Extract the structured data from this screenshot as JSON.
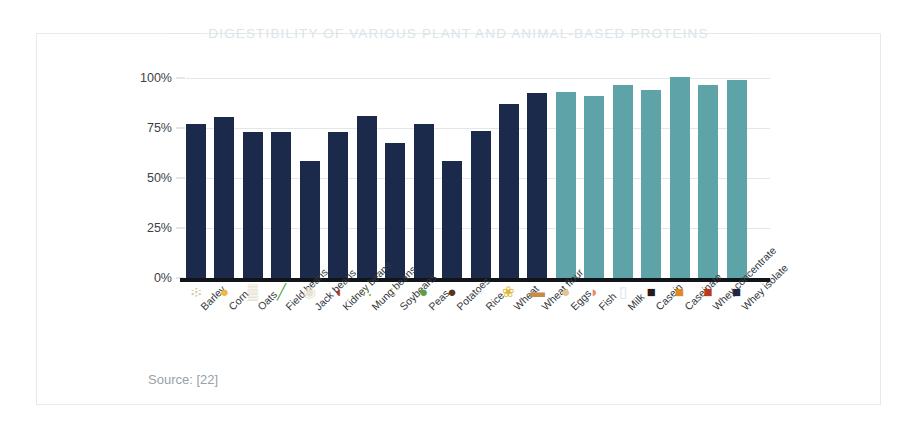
{
  "frame": {
    "border_color": "#e3ebee"
  },
  "header": {
    "title": "DIGESTIBILITY OF VARIOUS PLANT AND ANIMAL-BASED PROTEINS",
    "title_color": "#dce4e8",
    "rule_color": "#dfe6ea"
  },
  "footer": {
    "source": "Source: [22]"
  },
  "palette": {
    "plant_bar": "#1b2a4a",
    "animal_bar": "#5ea3a8",
    "gridline": "#e4e7e9",
    "axis": "#111418",
    "tick_text": "#3b3f46"
  },
  "chart_data": {
    "type": "bar",
    "title": "DIGESTIBILITY OF VARIOUS PLANT AND ANIMAL-BASED PROTEINS",
    "xlabel": "",
    "ylabel": "",
    "ylim": [
      0,
      100
    ],
    "yticks": [
      "0%",
      "25%",
      "50%",
      "75%",
      "100%"
    ],
    "ytick_values": [
      0,
      25,
      50,
      75,
      100
    ],
    "grid": true,
    "legend": "none",
    "unit": "%",
    "categories": [
      "Barley",
      "Corn",
      "Oats",
      "Field beans",
      "Jack beans",
      "Kidney beans",
      "Mung beans",
      "Soybeans",
      "Peas",
      "Potatoes",
      "Rice",
      "Wheat",
      "Wheat flour",
      "Eggs",
      "Fish",
      "Milk",
      "Casein",
      "Caseinate",
      "Whey concentrate",
      "Whey isolate"
    ],
    "values": [
      77,
      80.5,
      73,
      73,
      58.5,
      73,
      81,
      67.5,
      77,
      58.5,
      73.5,
      87,
      92.5,
      93,
      91,
      96.5,
      94,
      100.5,
      96.5,
      99
    ],
    "groups": [
      "plant",
      "plant",
      "plant",
      "plant",
      "plant",
      "plant",
      "plant",
      "plant",
      "plant",
      "plant",
      "plant",
      "plant",
      "plant",
      "animal",
      "animal",
      "animal",
      "animal",
      "animal",
      "animal",
      "animal"
    ],
    "icons": [
      "barley-grain-icon",
      "corn-kernels-icon",
      "oats-icon",
      "field-beans-icon",
      "jack-beans-icon",
      "kidney-beans-icon",
      "mung-beans-icon",
      "soybeans-icon",
      "peas-icon",
      "potatoes-icon",
      "rice-icon",
      "wheat-icon",
      "wheat-flour-icon",
      "eggs-icon",
      "fish-icon",
      "milk-icon",
      "casein-jar-icon",
      "caseinate-jar-icon",
      "whey-concentrate-jar-icon",
      "whey-isolate-jar-icon"
    ],
    "icon_glyphs": [
      "፨",
      "●",
      "▒",
      "╱",
      "◉",
      "◖",
      "∴",
      "∵",
      "●",
      "●",
      "▫",
      "❀",
      "▬",
      "●",
      "◗",
      "▯",
      "■",
      "■",
      "■",
      "■"
    ],
    "icon_colors": [
      "#d9c9a3",
      "#f0b93c",
      "#cdbd96",
      "#5aa845",
      "#e8e2cf",
      "#b03a2e",
      "#7fb040",
      "#e4c97a",
      "#5f9e3a",
      "#5a3418",
      "#efece3",
      "#e0b83c",
      "#c78b4a",
      "#e8c48a",
      "#e8896a",
      "#cfe4f2",
      "#2b1a14",
      "#e08a1e",
      "#c0381a",
      "#1f2740"
    ]
  }
}
